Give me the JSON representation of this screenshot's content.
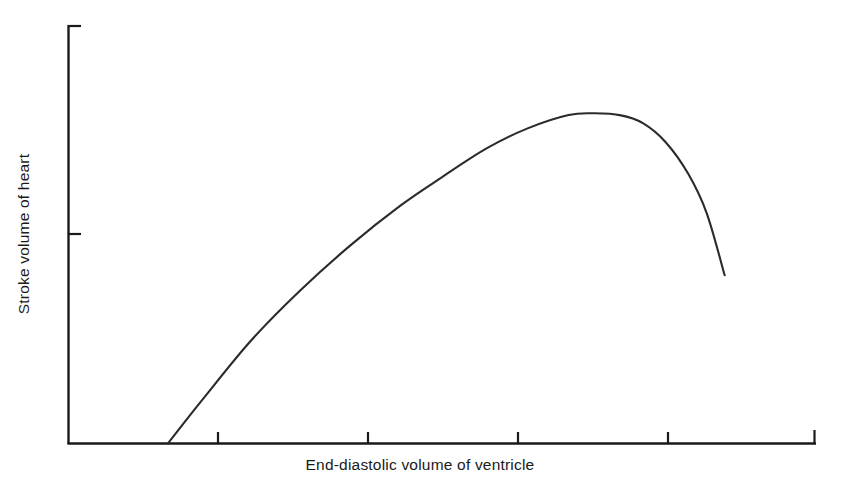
{
  "figure": {
    "background_color": "#ffffff",
    "ink_color": "#1a1a1a",
    "curve_color": "#2b2b2b",
    "x_axis_label": "End-diastolic volume of ventricle",
    "y_axis_label": "Stroke volume of heart"
  },
  "chart_data": {
    "type": "line",
    "title": "",
    "xlabel": "End-diastolic volume of ventricle",
    "ylabel": "Stroke volume of heart",
    "grid": false,
    "legend": null,
    "axis_style": "open-corner L axes with end caps",
    "xlim": [
      0,
      100
    ],
    "ylim": [
      0,
      100
    ],
    "x_tick_labels": [
      "",
      "",
      "",
      "",
      ""
    ],
    "y_tick_labels": [
      "",
      ""
    ],
    "x_tick_positions": [
      20,
      40,
      60,
      80
    ],
    "y_tick_positions": [
      50,
      100
    ],
    "series": [
      {
        "name": "Frank-Starling curve",
        "x": [
          13.3,
          18.0,
          24.4,
          31.0,
          37.8,
          44.5,
          50.0,
          56.0,
          61.5,
          67.0,
          70.5,
          74.0,
          77.0,
          80.0,
          83.0,
          85.5,
          87.9
        ],
        "y": [
          0.0,
          10.6,
          24.5,
          36.5,
          47.4,
          56.9,
          63.6,
          70.5,
          75.3,
          78.5,
          78.9,
          78.4,
          76.5,
          72.0,
          64.5,
          55.0,
          40.2
        ]
      }
    ],
    "annotations": []
  }
}
